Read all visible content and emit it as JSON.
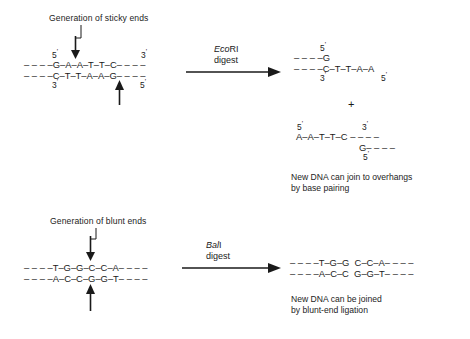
{
  "figure": {
    "ink_color": "#1a1a1a",
    "background_color": "#ffffff"
  },
  "panels": [
    {
      "id": "sticky",
      "caption": "Generation of sticky ends",
      "enzyme": {
        "genus": "Eco",
        "roman": "RI",
        "action": "digest"
      },
      "substrate": {
        "top_strand": "– – – –G–A–A–T–T–C– – – –",
        "bottom_strand": "– – – –C–T–T–A–A–G– – – –",
        "top_left_prime": "5",
        "top_right_prime": "3",
        "bottom_left_prime": "3",
        "bottom_right_prime": "5",
        "cut_marker_top": "down-arrow",
        "cut_marker_bottom": "up-arrow"
      },
      "products": [
        {
          "top_strand": "– – – –G",
          "bottom_strand": "– – – –C–T–T–A–A",
          "top_left_prime": "5",
          "bottom_left_prime": "3",
          "bottom_right_prime": "5"
        },
        {
          "top_strand": "A–A–T–T–C – – – –",
          "bottom_strand": "G– – – –",
          "top_left_prime": "5",
          "top_right_prime": "3",
          "bottom_right_prime": "5"
        }
      ],
      "separator": "+",
      "note_line1": "New DNA can join to overhangs",
      "note_line2": "by base pairing"
    },
    {
      "id": "blunt",
      "caption": "Generation of blunt ends",
      "enzyme": {
        "genus": "Bal",
        "roman": "I",
        "action": "digest"
      },
      "substrate": {
        "top_strand": "– – – –T–G–G–C–C–A– – – –",
        "bottom_strand": "– – – –A–C–C–G–G–T– – – –",
        "cut_marker_top": "down-arrow",
        "cut_marker_bottom": "up-arrow"
      },
      "products": [
        {
          "top_strand": "– – – –T–G–G  C–C–A– – – –",
          "bottom_strand": "– – – –A–C–C  G–G–T– – – –"
        }
      ],
      "note_line1": "New DNA can be joined",
      "note_line2": "by blunt-end ligation"
    }
  ]
}
